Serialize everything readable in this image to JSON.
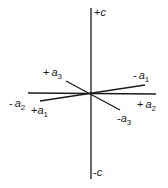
{
  "diagram": {
    "type": "axis-orientation-diagram",
    "axes": [
      {
        "name": "c",
        "positive_label": {
          "sign": "+",
          "symbol": "c",
          "subscript": ""
        },
        "negative_label": {
          "sign": "-",
          "symbol": "c",
          "subscript": ""
        }
      },
      {
        "name": "a1",
        "positive_label": {
          "sign": "+",
          "symbol": "a",
          "subscript": "1"
        },
        "negative_label": {
          "sign": "-",
          "symbol": "a",
          "subscript": "1"
        }
      },
      {
        "name": "a2",
        "positive_label": {
          "sign": "+",
          "symbol": "a",
          "subscript": "2"
        },
        "negative_label": {
          "sign": "-",
          "symbol": "a",
          "subscript": "2"
        }
      },
      {
        "name": "a3",
        "positive_label": {
          "sign": "+",
          "symbol": "a",
          "subscript": "3"
        },
        "negative_label": {
          "sign": "-",
          "symbol": "a",
          "subscript": "3"
        }
      }
    ],
    "labels": {
      "plus_c": {
        "sign": "+",
        "symbol": "c",
        "sub": ""
      },
      "minus_c": {
        "sign": "-",
        "symbol": "c",
        "sub": ""
      },
      "plus_a3": {
        "sign": "+",
        "symbol": "a",
        "sub": "3"
      },
      "minus_a1": {
        "sign": "-",
        "symbol": "a",
        "sub": "1"
      },
      "minus_a2": {
        "sign": "-",
        "symbol": "a",
        "sub": "2"
      },
      "plus_a1": {
        "sign": "+",
        "symbol": "a",
        "sub": "1"
      },
      "plus_a2": {
        "sign": "+",
        "symbol": "a",
        "sub": "2"
      },
      "minus_a3": {
        "sign": "-",
        "symbol": "a",
        "sub": "3"
      }
    },
    "line_color": "#1a1a1a"
  }
}
